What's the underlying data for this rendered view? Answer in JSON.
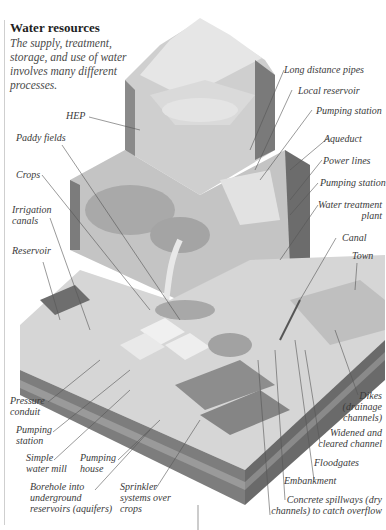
{
  "header": {
    "title": "Water resources",
    "intro": "The supply, treatment, storage, and use of water involves many different processes."
  },
  "labels": {
    "long_distance_pipes": "Long distance pipes",
    "local_reservoir": "Local reservoir",
    "pumping_station_top": "Pumping station",
    "aqueduct": "Aqueduct",
    "power_lines": "Power lines",
    "pumping_station_right": "Pumping station",
    "water_treatment_1": "Water treatment",
    "water_treatment_2": "plant",
    "canal": "Canal",
    "town": "Town",
    "hep": "HEP",
    "paddy_fields": "Paddy fields",
    "crops": "Crops",
    "irrigation_1": "Irrigation",
    "irrigation_2": "canals",
    "reservoir": "Reservoir",
    "pressure_1": "Pressure",
    "pressure_2": "conduit",
    "pumping_station_left_1": "Pumping",
    "pumping_station_left_2": "station",
    "water_mill_1": "Simple",
    "water_mill_2": "water mill",
    "pumping_house_1": "Pumping",
    "pumping_house_2": "house",
    "borehole_1": "Borehole into",
    "borehole_2": "underground",
    "borehole_3": "reservoirs (aquifers)",
    "sprinkler_1": "Sprinkler",
    "sprinkler_2": "systems over",
    "sprinkler_3": "crops",
    "dikes_1": "Dikes",
    "dikes_2": "(drainage",
    "dikes_3": "channels)",
    "widened_1": "Widened and",
    "widened_2": "cleared channel",
    "floodgates": "Floodgates",
    "embankment": "Embankment",
    "spillways_1": "Concrete spillways (dry",
    "spillways_2": "channels) to catch overflow"
  },
  "colors": {
    "sky": "#ffffff",
    "land_light": "#d8d8d8",
    "land_mid": "#b5b5b5",
    "strata_dark": "#6e6e6e",
    "mountain": "#c9c9c9",
    "leader_line": "#555555"
  }
}
